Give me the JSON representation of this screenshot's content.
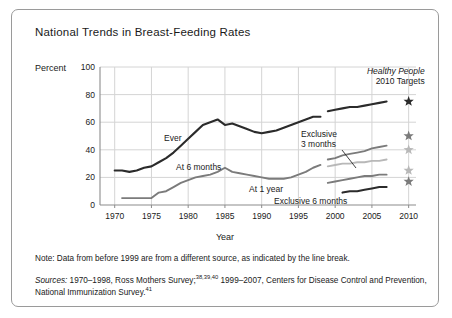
{
  "title": "National Trends in Breast-Feeding Rates",
  "axis": {
    "ylabel": "Percent",
    "xlabel": "Year",
    "yticks": [
      "0",
      "20",
      "40",
      "60",
      "80",
      "100"
    ],
    "xticks": [
      "1970",
      "1975",
      "1980",
      "1985",
      "1990",
      "1995",
      "2000",
      "2005",
      "2010"
    ]
  },
  "annotations": {
    "hp_line1": "Healthy People",
    "hp_line2": "2010 Targets",
    "ever": "Ever",
    "at6months": "At 6 months",
    "exclusive3a": "Exclusive",
    "exclusive3b": "3 months",
    "at1year": "At 1 year",
    "exclusive6": "Exclusive 6 months"
  },
  "note": "Note: Data from before 1999 are from a different source, as indicated by the line break.",
  "sources": {
    "label": "Sources:",
    "part1": " 1970–1998, Ross Mothers Survey;",
    "sup1": "38,39,40",
    "part2": " 1999–2007, Centers for Disease Control and Prevention, National Immunization Survey.",
    "sup2": "41"
  },
  "colors": {
    "dark": "#2b2b2b",
    "mid": "#7b7b7b",
    "light": "#b8b8b8",
    "grid": "#d4d4d4",
    "axis": "#8c8c8c",
    "border": "#9a9a9a"
  },
  "chart_data": {
    "type": "line",
    "title": "National Trends in Breast-Feeding Rates",
    "xlabel": "Year",
    "ylabel": "Percent",
    "xlim": [
      1968,
      2011
    ],
    "ylim": [
      0,
      100
    ],
    "grid": true,
    "legend": "inline-labels",
    "note": "Data from before 1999 are from a different source, as indicated by the line break.",
    "series": [
      {
        "name": "Ever",
        "color": "#2b2b2b",
        "segments": [
          {
            "period": "1970-1998",
            "x": [
              1970,
              1971,
              1972,
              1973,
              1974,
              1975,
              1976,
              1977,
              1978,
              1979,
              1980,
              1981,
              1982,
              1983,
              1984,
              1985,
              1986,
              1987,
              1988,
              1989,
              1990,
              1991,
              1992,
              1993,
              1994,
              1995,
              1996,
              1997,
              1998
            ],
            "y": [
              25,
              25,
              24,
              25,
              27,
              28,
              31,
              34,
              38,
              43,
              48,
              53,
              58,
              60,
              62,
              58,
              59,
              57,
              55,
              53,
              52,
              53,
              54,
              56,
              58,
              60,
              62,
              64,
              64
            ]
          },
          {
            "period": "1999-2007",
            "x": [
              1999,
              2000,
              2001,
              2002,
              2003,
              2004,
              2005,
              2006,
              2007
            ],
            "y": [
              68,
              69,
              70,
              71,
              71,
              72,
              73,
              74,
              75
            ]
          }
        ]
      },
      {
        "name": "At 6 months",
        "color": "#7b7b7b",
        "segments": [
          {
            "period": "1971-1998",
            "x": [
              1971,
              1972,
              1973,
              1974,
              1975,
              1976,
              1977,
              1978,
              1979,
              1980,
              1981,
              1982,
              1983,
              1984,
              1985,
              1986,
              1987,
              1988,
              1989,
              1990,
              1991,
              1992,
              1993,
              1994,
              1995,
              1996,
              1997,
              1998
            ],
            "y": [
              5,
              5,
              5,
              5,
              5,
              9,
              10,
              13,
              16,
              18,
              20,
              21,
              22,
              24,
              27,
              24,
              23,
              22,
              21,
              20,
              19,
              19,
              19,
              20,
              22,
              24,
              27,
              29
            ]
          },
          {
            "period": "1999-2007",
            "x": [
              1999,
              2000,
              2001,
              2002,
              2003,
              2004,
              2005,
              2006,
              2007
            ],
            "y": [
              33,
              34,
              36,
              37,
              38,
              39,
              41,
              42,
              43
            ]
          }
        ]
      },
      {
        "name": "Exclusive 3 months",
        "color": "#b8b8b8",
        "segments": [
          {
            "period": "1999-2007",
            "x": [
              1999,
              2000,
              2001,
              2002,
              2003,
              2004,
              2005,
              2006,
              2007
            ],
            "y": [
              28,
              29,
              30,
              30,
              31,
              31,
              32,
              32,
              33
            ]
          }
        ]
      },
      {
        "name": "At 1 year",
        "color": "#7b7b7b",
        "segments": [
          {
            "period": "1999-2007",
            "x": [
              1999,
              2000,
              2001,
              2002,
              2003,
              2004,
              2005,
              2006,
              2007
            ],
            "y": [
              16,
              17,
              18,
              19,
              20,
              21,
              21,
              22,
              22
            ]
          }
        ]
      },
      {
        "name": "Exclusive 6 months",
        "color": "#2b2b2b",
        "segments": [
          {
            "period": "2001-2007",
            "x": [
              2001,
              2002,
              2003,
              2004,
              2005,
              2006,
              2007
            ],
            "y": [
              9,
              10,
              10,
              11,
              12,
              13,
              13
            ]
          }
        ]
      }
    ],
    "targets": {
      "name": "Healthy People 2010 Targets",
      "x": 2010,
      "points": [
        {
          "label": "Ever",
          "value": 75,
          "color": "#2b2b2b"
        },
        {
          "label": "At 6 months",
          "value": 50,
          "color": "#7b7b7b"
        },
        {
          "label": "Exclusive 3 months",
          "value": 40,
          "color": "#b8b8b8"
        },
        {
          "label": "At 1 year",
          "value": 25,
          "color": "#b8b8b8"
        },
        {
          "label": "Exclusive 6 months",
          "value": 17,
          "color": "#7b7b7b"
        }
      ]
    }
  }
}
